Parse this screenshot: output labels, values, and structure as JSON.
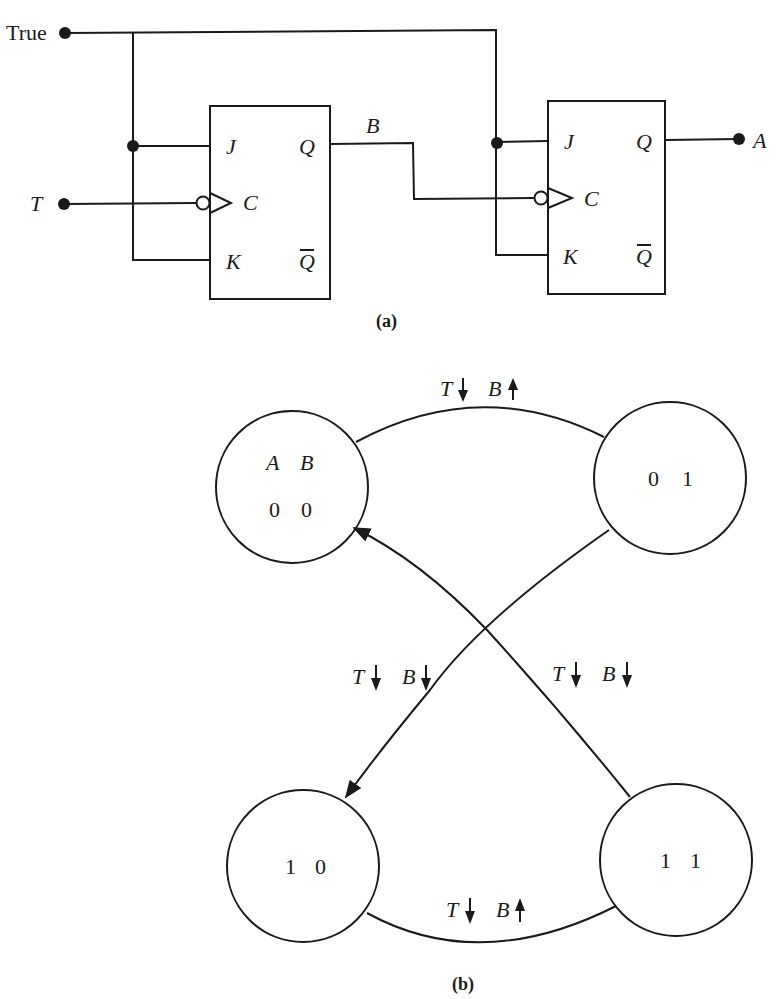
{
  "circuit": {
    "caption": "(a)",
    "inputs": {
      "true_label": "True",
      "clock_label": "T"
    },
    "output_label": "A",
    "intermediate_label": "B",
    "flip_flops": [
      {
        "name": "FF-B",
        "pins": {
          "j": "J",
          "k": "K",
          "c": "C",
          "q": "Q",
          "qbar": "Q"
        }
      },
      {
        "name": "FF-A",
        "pins": {
          "j": "J",
          "k": "K",
          "c": "C",
          "q": "Q",
          "qbar": "Q"
        }
      }
    ]
  },
  "state_diagram": {
    "caption": "(b)",
    "header": {
      "a": "A",
      "b": "B"
    },
    "states": [
      {
        "id": "s00",
        "a": "0",
        "b": "0"
      },
      {
        "id": "s01",
        "a": "0",
        "b": "1"
      },
      {
        "id": "s10",
        "a": "1",
        "b": "0"
      },
      {
        "id": "s11",
        "a": "1",
        "b": "1"
      }
    ],
    "transitions": [
      {
        "from": "00",
        "to": "01",
        "t_label": "T",
        "t_dir": "down",
        "b_label": "B",
        "b_dir": "up"
      },
      {
        "from": "01",
        "to": "10",
        "t_label": "T",
        "t_dir": "down",
        "b_label": "B",
        "b_dir": "down"
      },
      {
        "from": "10",
        "to": "11",
        "t_label": "T",
        "t_dir": "down",
        "b_label": "B",
        "b_dir": "up"
      },
      {
        "from": "11",
        "to": "00",
        "t_label": "T",
        "t_dir": "down",
        "b_label": "B",
        "b_dir": "down"
      }
    ]
  }
}
